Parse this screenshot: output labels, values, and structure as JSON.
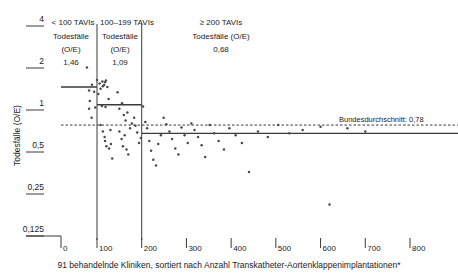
{
  "chart_data": {
    "type": "scatter",
    "title": "",
    "xlabel": "91 behandelnde Kliniken, sortiert nach Anzahl Transkatheter-Aortenklappenimplantationen*",
    "ylabel": "Todesfälle (O/E)",
    "yscale": "log2",
    "ylim": [
      0.1,
      4.6
    ],
    "xlim": [
      0,
      840
    ],
    "yticks": [
      4,
      2,
      1,
      0.5,
      0.25,
      0.125
    ],
    "yticklabels": [
      "4",
      "2",
      "1",
      "0,5",
      "0,25",
      "0,125"
    ],
    "xticks": [
      0,
      100,
      200,
      300,
      400,
      500,
      600,
      700,
      800
    ],
    "xticklabels": [
      "0",
      "100",
      "200",
      "300",
      "400",
      "500",
      "600",
      "700",
      "800"
    ],
    "grid": false,
    "legend": "none",
    "groups": [
      {
        "id": "g1",
        "header": "< 100 TAVIs",
        "metric_label_line1": "Todesfälle",
        "metric_label_line2": "(O/E)",
        "value": "1,46",
        "value_num": 1.46,
        "x_from": 0,
        "x_to": 100
      },
      {
        "id": "g2",
        "header": "100–199 TAVIs",
        "metric_label_line1": "Todesfälle",
        "metric_label_line2": "(O/E)",
        "value": "1,09",
        "value_num": 1.09,
        "x_from": 100,
        "x_to": 200
      },
      {
        "id": "g3",
        "header": "≥ 200 TAVIs",
        "metric_label_line1": "Todesfälle (O/E)",
        "metric_label_line2": "",
        "value": "0,68",
        "value_num": 0.68,
        "x_from": 200,
        "x_to": 840
      }
    ],
    "reference_line": {
      "label": "Bundesdurchschnitt: 0,78",
      "value": 0.78
    },
    "points": [
      {
        "x": 72,
        "y": 2.02
      },
      {
        "x": 78,
        "y": 1.38
      },
      {
        "x": 80,
        "y": 1.16
      },
      {
        "x": 78,
        "y": 1.02
      },
      {
        "x": 85,
        "y": 0.88
      },
      {
        "x": 86,
        "y": 1.52
      },
      {
        "x": 92,
        "y": 1.35
      },
      {
        "x": 95,
        "y": 1.04
      },
      {
        "x": 100,
        "y": 1.64
      },
      {
        "x": 103,
        "y": 1.3
      },
      {
        "x": 106,
        "y": 1.55
      },
      {
        "x": 108,
        "y": 1.42
      },
      {
        "x": 112,
        "y": 1.6
      },
      {
        "x": 113,
        "y": 1.48
      },
      {
        "x": 116,
        "y": 1.51
      },
      {
        "x": 118,
        "y": 1.58
      },
      {
        "x": 120,
        "y": 1.63
      },
      {
        "x": 111,
        "y": 1.07
      },
      {
        "x": 119,
        "y": 1.05
      },
      {
        "x": 123,
        "y": 1.46
      },
      {
        "x": 126,
        "y": 1.2
      },
      {
        "x": 108,
        "y": 0.78
      },
      {
        "x": 113,
        "y": 0.7
      },
      {
        "x": 117,
        "y": 0.64
      },
      {
        "x": 118,
        "y": 0.6
      },
      {
        "x": 121,
        "y": 0.55
      },
      {
        "x": 127,
        "y": 0.53
      },
      {
        "x": 131,
        "y": 0.57
      },
      {
        "x": 134,
        "y": 0.45
      },
      {
        "x": 130,
        "y": 0.72
      },
      {
        "x": 146,
        "y": 1.34
      },
      {
        "x": 150,
        "y": 1.02
      },
      {
        "x": 156,
        "y": 1.12
      },
      {
        "x": 160,
        "y": 0.92
      },
      {
        "x": 164,
        "y": 0.84
      },
      {
        "x": 168,
        "y": 0.96
      },
      {
        "x": 150,
        "y": 0.7
      },
      {
        "x": 155,
        "y": 0.62
      },
      {
        "x": 158,
        "y": 0.55
      },
      {
        "x": 162,
        "y": 0.66
      },
      {
        "x": 166,
        "y": 0.52
      },
      {
        "x": 170,
        "y": 0.48
      },
      {
        "x": 174,
        "y": 0.74
      },
      {
        "x": 178,
        "y": 0.8
      },
      {
        "x": 183,
        "y": 0.88
      },
      {
        "x": 186,
        "y": 0.77
      },
      {
        "x": 190,
        "y": 0.69
      },
      {
        "x": 194,
        "y": 0.58
      },
      {
        "x": 198,
        "y": 0.63
      },
      {
        "x": 203,
        "y": 1.06
      },
      {
        "x": 208,
        "y": 0.82
      },
      {
        "x": 212,
        "y": 0.74
      },
      {
        "x": 217,
        "y": 0.6
      },
      {
        "x": 221,
        "y": 0.51
      },
      {
        "x": 226,
        "y": 0.44
      },
      {
        "x": 232,
        "y": 0.4
      },
      {
        "x": 237,
        "y": 0.57
      },
      {
        "x": 243,
        "y": 0.66
      },
      {
        "x": 249,
        "y": 0.88
      },
      {
        "x": 255,
        "y": 0.79
      },
      {
        "x": 262,
        "y": 0.7
      },
      {
        "x": 268,
        "y": 0.62
      },
      {
        "x": 275,
        "y": 0.53
      },
      {
        "x": 282,
        "y": 0.48
      },
      {
        "x": 289,
        "y": 0.75
      },
      {
        "x": 296,
        "y": 0.66
      },
      {
        "x": 303,
        "y": 0.58
      },
      {
        "x": 311,
        "y": 0.8
      },
      {
        "x": 318,
        "y": 0.72
      },
      {
        "x": 326,
        "y": 0.64
      },
      {
        "x": 334,
        "y": 0.56
      },
      {
        "x": 342,
        "y": 0.46
      },
      {
        "x": 352,
        "y": 0.78
      },
      {
        "x": 362,
        "y": 0.68
      },
      {
        "x": 372,
        "y": 0.6
      },
      {
        "x": 384,
        "y": 0.52
      },
      {
        "x": 396,
        "y": 0.74
      },
      {
        "x": 410,
        "y": 0.66
      },
      {
        "x": 424,
        "y": 0.58
      },
      {
        "x": 440,
        "y": 0.36
      },
      {
        "x": 460,
        "y": 0.7
      },
      {
        "x": 482,
        "y": 0.64
      },
      {
        "x": 505,
        "y": 0.78
      },
      {
        "x": 530,
        "y": 0.68
      },
      {
        "x": 560,
        "y": 0.72
      },
      {
        "x": 600,
        "y": 0.76
      },
      {
        "x": 620,
        "y": 0.21
      },
      {
        "x": 660,
        "y": 0.74
      },
      {
        "x": 700,
        "y": 0.7
      }
    ]
  }
}
